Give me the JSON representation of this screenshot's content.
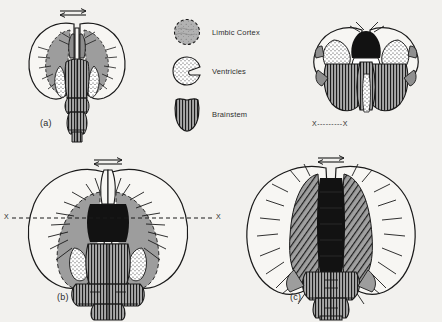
{
  "figure": {
    "background_color": "#f2f1ee",
    "ink_color": "#1a1a1a",
    "limbic_color": "#9d9d9d",
    "ventricle_color": "#ffffff",
    "brainstem_color": "#8f8f8f",
    "dark_mass_color": "#121212"
  },
  "legend": {
    "items": [
      {
        "id": "limbic-cortex",
        "label": "Limbic Cortex",
        "swatch": "dotted-circle-shaded"
      },
      {
        "id": "ventricles",
        "label": "Ventricles",
        "swatch": "stippled-comma"
      },
      {
        "id": "brainstem",
        "label": "Brainstem",
        "swatch": "vertical-hatch-shield"
      }
    ]
  },
  "panels": [
    {
      "id": "panel-a",
      "label": "(a)",
      "position": "top-left",
      "arrow": "double-headed-horizontal",
      "axis_label": ""
    },
    {
      "id": "panel-top-right",
      "label": "",
      "position": "top-right",
      "arrow": "",
      "axis_label": "X---------X"
    },
    {
      "id": "panel-b",
      "label": "(b)",
      "position": "bottom-left",
      "arrow": "double-headed-horizontal",
      "axis_label_left": "X",
      "axis_label_right": "X"
    },
    {
      "id": "panel-c",
      "label": "(c)",
      "position": "bottom-right",
      "arrow": "double-headed-horizontal",
      "axis_label": ""
    }
  ]
}
